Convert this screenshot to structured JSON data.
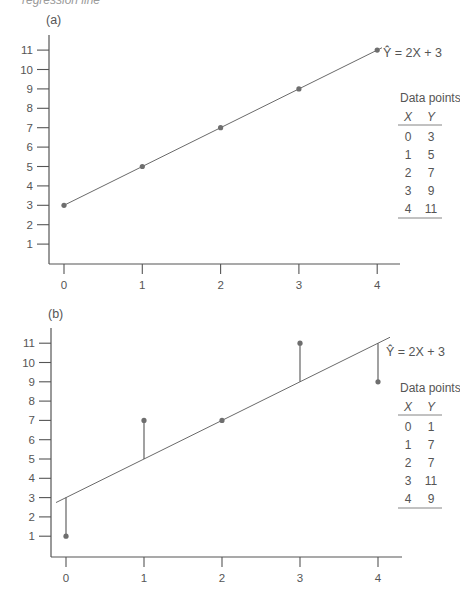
{
  "caption_fragment": "regression line",
  "chart_data": [
    {
      "type": "scatter",
      "panel_label": "(a)",
      "title": "",
      "xlabel": "",
      "ylabel": "",
      "xlim": [
        0,
        4
      ],
      "ylim": [
        0,
        11
      ],
      "x_ticks": [
        "0",
        "1",
        "2",
        "3",
        "4"
      ],
      "y_ticks": [
        "1",
        "2",
        "3",
        "4",
        "5",
        "6",
        "7",
        "8",
        "9",
        "10",
        "11"
      ],
      "grid": false,
      "equation": "Ŷ = 2X + 3",
      "regression": {
        "slope": 2,
        "intercept": 3
      },
      "points": {
        "x": [
          0,
          1,
          2,
          3,
          4
        ],
        "y": [
          3,
          5,
          7,
          9,
          11
        ]
      },
      "residual_lines": false,
      "table": {
        "title": "Data points",
        "headers": [
          "X",
          "Y"
        ],
        "rows": [
          [
            "0",
            "3"
          ],
          [
            "1",
            "5"
          ],
          [
            "2",
            "7"
          ],
          [
            "3",
            "9"
          ],
          [
            "4",
            "11"
          ]
        ]
      }
    },
    {
      "type": "scatter",
      "panel_label": "(b)",
      "title": "",
      "xlabel": "",
      "ylabel": "",
      "xlim": [
        0,
        4
      ],
      "ylim": [
        0,
        11
      ],
      "x_ticks": [
        "0",
        "1",
        "2",
        "3",
        "4"
      ],
      "y_ticks": [
        "1",
        "2",
        "3",
        "4",
        "5",
        "6",
        "7",
        "8",
        "9",
        "10",
        "11"
      ],
      "grid": false,
      "equation": "Ŷ = 2X + 3",
      "regression": {
        "slope": 2,
        "intercept": 3
      },
      "points": {
        "x": [
          0,
          1,
          2,
          3,
          4
        ],
        "y": [
          1,
          7,
          7,
          11,
          9
        ]
      },
      "residual_lines": true,
      "table": {
        "title": "Data points",
        "headers": [
          "X",
          "Y"
        ],
        "rows": [
          [
            "0",
            "1"
          ],
          [
            "1",
            "7"
          ],
          [
            "2",
            "7"
          ],
          [
            "3",
            "11"
          ],
          [
            "4",
            "9"
          ]
        ]
      }
    }
  ]
}
